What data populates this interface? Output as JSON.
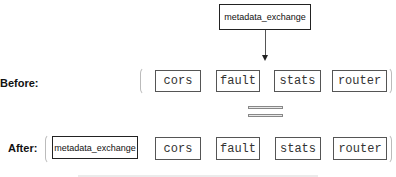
{
  "top": {
    "box_label": "metadata_exchange"
  },
  "before": {
    "label": "Before:",
    "filters": [
      "cors",
      "fault",
      "stats",
      "router"
    ]
  },
  "after": {
    "label": "After:",
    "filters": [
      "metadata_exchange",
      "cors",
      "fault",
      "stats",
      "router"
    ]
  },
  "symbols": {
    "equivalence": "equals-sign",
    "arrow": "down-arrow"
  },
  "colors": {
    "border": "#555555",
    "bold_border": "#222222",
    "bracket": "#bbbbbb"
  }
}
